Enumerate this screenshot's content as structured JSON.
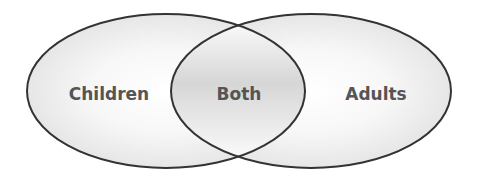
{
  "diagram": {
    "type": "venn",
    "sets": [
      {
        "label": "Children",
        "region": "left"
      },
      {
        "label": "Adults",
        "region": "right"
      }
    ],
    "intersection": {
      "label": "Both"
    },
    "colors": {
      "stroke": "#333333",
      "text": "#555555",
      "fill_light": "#ffffff",
      "fill_shade": "#dcdcdc"
    }
  }
}
